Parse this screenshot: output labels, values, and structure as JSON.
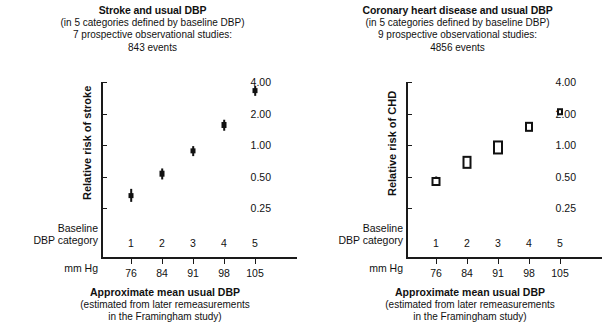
{
  "figure": {
    "background": "#ffffff",
    "ink_color": "#111111"
  },
  "chart_data": [
    {
      "type": "scatter",
      "panel_id": "stroke",
      "title": "Stroke and usual DBP",
      "subtitle_lines": [
        "(in 5 categories defined by baseline DBP)",
        "7 prospective observational studies:",
        "843 events"
      ],
      "study_count": 7,
      "event_count": 843,
      "category_count": 5,
      "ylabel": "Relative risk of stroke",
      "xlabel": "Approximate mean usual DBP",
      "xlabel_sub_lines": [
        "(estimated from later remeasurements",
        "in the Framingham study)"
      ],
      "yscale": "log",
      "yticks": [
        0.25,
        0.5,
        1.0,
        2.0,
        4.0
      ],
      "ytick_labels": [
        "0.25",
        "0.50",
        "1.00",
        "2.00",
        "4.00"
      ],
      "ylim": [
        0.2,
        4.6
      ],
      "grid": false,
      "legend": null,
      "marker_style": "filled-square",
      "row_label_category": [
        "Baseline",
        "DBP category"
      ],
      "row_label_units": "mm Hg",
      "categories": [
        "1",
        "2",
        "3",
        "4",
        "5"
      ],
      "x": [
        76,
        84,
        91,
        98,
        105
      ],
      "xtick_labels": [
        "76",
        "84",
        "91",
        "98",
        "105"
      ],
      "values": [
        0.33,
        0.53,
        0.88,
        1.55,
        3.3
      ],
      "ci_low": [
        0.29,
        0.47,
        0.79,
        1.38,
        2.95
      ],
      "ci_high": [
        0.38,
        0.6,
        0.98,
        1.74,
        3.7
      ]
    },
    {
      "type": "scatter",
      "panel_id": "chd",
      "title": "Coronary heart disease and usual DBP",
      "subtitle_lines": [
        "(in 5 categories defined by baseline DBP)",
        "9 prospective observational studies:",
        "4856 events"
      ],
      "study_count": 9,
      "event_count": 4856,
      "category_count": 5,
      "ylabel": "Relative risk of CHD",
      "xlabel": "Approximate mean usual DBP",
      "xlabel_sub_lines": [
        "(estimated from later remeasurements",
        "in the Framingham study)"
      ],
      "yscale": "log",
      "yticks": [
        0.25,
        0.5,
        1.0,
        2.0,
        4.0
      ],
      "ytick_labels": [
        "0.25",
        "0.50",
        "1.00",
        "2.00",
        "4.00"
      ],
      "ylim": [
        0.2,
        4.6
      ],
      "grid": false,
      "legend": null,
      "marker_style": "open-box",
      "row_label_category": [
        "Baseline",
        "DBP category"
      ],
      "row_label_units": "mm Hg",
      "categories": [
        "1",
        "2",
        "3",
        "4",
        "5"
      ],
      "x": [
        76,
        84,
        91,
        98,
        105
      ],
      "xtick_labels": [
        "76",
        "84",
        "91",
        "98",
        "105"
      ],
      "values": [
        0.45,
        0.68,
        0.95,
        1.5,
        2.1
      ],
      "ci_low": [
        0.41,
        0.6,
        0.86,
        1.4,
        2.0
      ],
      "ci_high": [
        0.5,
        0.77,
        1.05,
        1.61,
        2.21
      ]
    }
  ]
}
